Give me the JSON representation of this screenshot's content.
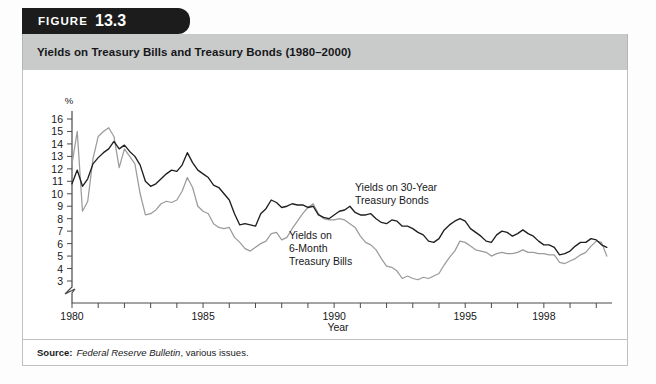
{
  "figure": {
    "word": "FIGURE",
    "number": "13.3"
  },
  "title": "Yields on Treasury Bills and Treasury Bonds (1980–2000)",
  "source": {
    "label": "Source:",
    "publication": "Federal Reserve Bulletin",
    "rest": ", various issues."
  },
  "annotations": {
    "bonds_line1": "Yields on 30-Year",
    "bonds_line2": "Treasury Bonds",
    "bills_line1": "Yields on",
    "bills_line2": "6-Month",
    "bills_line3": "Treasury Bills"
  },
  "chart_data": {
    "type": "line",
    "title": "Yields on Treasury Bills and Treasury Bonds (1980–2000)",
    "xlabel": "Year",
    "ylabel": "%",
    "xlim": [
      1980,
      2000
    ],
    "ylim": [
      3,
      16
    ],
    "y_axis_break_below": 3,
    "grid": false,
    "legend": "annotated-inline",
    "yticks": [
      16,
      15,
      14,
      13,
      12,
      11,
      10,
      9,
      8,
      7,
      6,
      5,
      4,
      3
    ],
    "ytick_labels": [
      "16",
      "15",
      "14",
      "13",
      "12",
      "11",
      "10",
      "9",
      "8",
      "7",
      "6",
      "5",
      "4",
      "3"
    ],
    "xticks": [
      1980,
      1981,
      1982,
      1983,
      1984,
      1985,
      1986,
      1987,
      1988,
      1989,
      1990,
      1991,
      1992,
      1993,
      1994,
      1995,
      1996,
      1997,
      1998,
      1999,
      2000
    ],
    "xtick_labels_shown": [
      "1980",
      "1985",
      "1990",
      "1995",
      "1998"
    ],
    "xtick_labels_shown_at": [
      1980,
      1985,
      1990,
      1995,
      1998
    ],
    "series": [
      {
        "name": "Yields on 30-Year Treasury Bonds",
        "color": "#1f1f1f",
        "x": [
          1980.0,
          1980.2,
          1980.4,
          1980.6,
          1980.8,
          1981.0,
          1981.2,
          1981.4,
          1981.6,
          1981.8,
          1982.0,
          1982.2,
          1982.4,
          1982.6,
          1982.8,
          1983.0,
          1983.2,
          1983.4,
          1983.6,
          1983.8,
          1984.0,
          1984.2,
          1984.4,
          1984.6,
          1984.8,
          1985.0,
          1985.2,
          1985.4,
          1985.6,
          1985.8,
          1986.0,
          1986.2,
          1986.4,
          1986.6,
          1986.8,
          1987.0,
          1987.2,
          1987.4,
          1987.6,
          1987.8,
          1988.0,
          1988.2,
          1988.4,
          1988.6,
          1988.8,
          1989.0,
          1989.2,
          1989.4,
          1989.6,
          1989.8,
          1990.0,
          1990.2,
          1990.4,
          1990.6,
          1990.8,
          1991.0,
          1991.2,
          1991.4,
          1991.6,
          1991.8,
          1992.0,
          1992.2,
          1992.4,
          1992.6,
          1992.8,
          1993.0,
          1993.2,
          1993.4,
          1993.6,
          1993.8,
          1994.0,
          1994.2,
          1994.4,
          1994.6,
          1994.8,
          1995.0,
          1995.2,
          1995.4,
          1995.6,
          1995.8,
          1996.0,
          1996.2,
          1996.4,
          1996.6,
          1996.8,
          1997.0,
          1997.2,
          1997.4,
          1997.6,
          1997.8,
          1998.0,
          1998.2,
          1998.4,
          1998.6,
          1998.8,
          1999.0,
          1999.2,
          1999.4,
          1999.6,
          1999.8,
          2000.0,
          2000.2,
          2000.4
        ],
        "y": [
          10.8,
          11.9,
          10.6,
          11.2,
          12.4,
          12.9,
          13.3,
          13.6,
          14.2,
          13.6,
          13.9,
          13.4,
          13.0,
          12.3,
          11.0,
          10.6,
          10.8,
          11.2,
          11.6,
          11.9,
          11.8,
          12.3,
          13.3,
          12.5,
          11.9,
          11.6,
          11.3,
          10.7,
          10.5,
          10.0,
          9.5,
          8.4,
          7.5,
          7.6,
          7.5,
          7.4,
          8.4,
          8.8,
          9.5,
          9.3,
          8.9,
          9.0,
          9.2,
          9.1,
          9.1,
          8.9,
          9.0,
          8.3,
          8.1,
          8.0,
          8.3,
          8.6,
          8.7,
          9.0,
          8.5,
          8.3,
          8.3,
          8.4,
          8.0,
          7.7,
          7.6,
          7.9,
          7.8,
          7.4,
          7.4,
          7.2,
          6.9,
          6.7,
          6.2,
          6.1,
          6.4,
          7.1,
          7.5,
          7.8,
          8.0,
          7.8,
          7.2,
          6.9,
          6.6,
          6.2,
          6.1,
          6.7,
          7.0,
          6.9,
          6.6,
          6.8,
          7.1,
          6.8,
          6.6,
          6.2,
          5.9,
          5.9,
          5.7,
          5.1,
          5.2,
          5.4,
          5.8,
          6.1,
          6.1,
          6.4,
          6.3,
          5.9,
          5.7
        ]
      },
      {
        "name": "Yields on 6-Month Treasury Bills",
        "color": "#9b9b9b",
        "x": [
          1980.0,
          1980.2,
          1980.4,
          1980.6,
          1980.8,
          1981.0,
          1981.2,
          1981.4,
          1981.6,
          1981.8,
          1982.0,
          1982.2,
          1982.4,
          1982.6,
          1982.8,
          1983.0,
          1983.2,
          1983.4,
          1983.6,
          1983.8,
          1984.0,
          1984.2,
          1984.4,
          1984.6,
          1984.8,
          1985.0,
          1985.2,
          1985.4,
          1985.6,
          1985.8,
          1986.0,
          1986.2,
          1986.4,
          1986.6,
          1986.8,
          1987.0,
          1987.2,
          1987.4,
          1987.6,
          1987.8,
          1988.0,
          1988.2,
          1988.4,
          1988.6,
          1988.8,
          1989.0,
          1989.2,
          1989.4,
          1989.6,
          1989.8,
          1990.0,
          1990.2,
          1990.4,
          1990.6,
          1990.8,
          1991.0,
          1991.2,
          1991.4,
          1991.6,
          1991.8,
          1992.0,
          1992.2,
          1992.4,
          1992.6,
          1992.8,
          1993.0,
          1993.2,
          1993.4,
          1993.6,
          1993.8,
          1994.0,
          1994.2,
          1994.4,
          1994.6,
          1994.8,
          1995.0,
          1995.2,
          1995.4,
          1995.6,
          1995.8,
          1996.0,
          1996.2,
          1996.4,
          1996.6,
          1996.8,
          1997.0,
          1997.2,
          1997.4,
          1997.6,
          1997.8,
          1998.0,
          1998.2,
          1998.4,
          1998.6,
          1998.8,
          1999.0,
          1999.2,
          1999.4,
          1999.6,
          1999.8,
          2000.0,
          2000.2,
          2000.4
        ],
        "y": [
          12.4,
          15.0,
          8.6,
          9.4,
          12.8,
          14.6,
          15.0,
          15.3,
          14.6,
          12.1,
          13.6,
          13.0,
          12.4,
          10.0,
          8.3,
          8.4,
          8.7,
          9.2,
          9.4,
          9.3,
          9.5,
          10.2,
          11.3,
          10.5,
          9.0,
          8.6,
          8.4,
          7.6,
          7.3,
          7.2,
          7.3,
          6.5,
          6.1,
          5.6,
          5.4,
          5.7,
          6.0,
          6.2,
          6.8,
          6.9,
          6.3,
          6.5,
          7.2,
          7.8,
          8.4,
          8.9,
          9.2,
          8.4,
          8.0,
          7.9,
          7.9,
          8.0,
          7.9,
          7.6,
          7.3,
          6.6,
          6.1,
          5.9,
          5.5,
          4.8,
          4.2,
          4.1,
          3.8,
          3.2,
          3.4,
          3.2,
          3.1,
          3.3,
          3.2,
          3.4,
          3.6,
          4.3,
          4.9,
          5.4,
          6.2,
          6.1,
          5.8,
          5.5,
          5.4,
          5.3,
          5.0,
          5.2,
          5.3,
          5.2,
          5.2,
          5.3,
          5.5,
          5.3,
          5.3,
          5.2,
          5.2,
          5.1,
          5.1,
          4.5,
          4.4,
          4.6,
          4.8,
          5.1,
          5.3,
          5.8,
          6.2,
          6.1,
          5.0
        ]
      }
    ]
  }
}
